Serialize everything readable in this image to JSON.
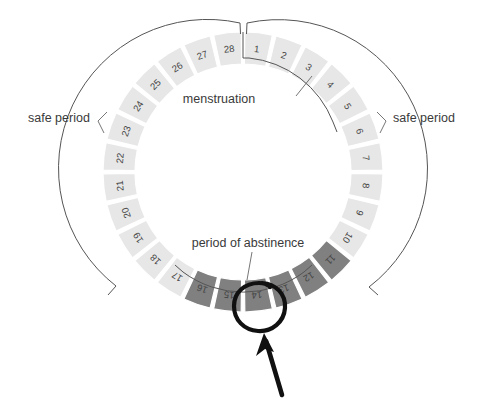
{
  "diagram": {
    "title_semantic": "menstrual-cycle-calendar-wheel",
    "cycle_length": 28,
    "center": {
      "x": 243,
      "y": 172
    },
    "ring": {
      "inner_radius": 108,
      "outer_radius": 140
    },
    "day_numbers": [
      1,
      2,
      3,
      4,
      5,
      6,
      7,
      8,
      9,
      10,
      11,
      12,
      13,
      14,
      15,
      16,
      17,
      18,
      19,
      20,
      21,
      22,
      23,
      24,
      25,
      26,
      27,
      28
    ],
    "segment_phase": [
      "safe",
      "safe",
      "safe",
      "safe",
      "safe",
      "safe",
      "safe",
      "safe",
      "safe",
      "safe",
      "abstinence",
      "abstinence",
      "abstinence",
      "abstinence",
      "abstinence",
      "abstinence",
      "safe",
      "safe",
      "safe",
      "safe",
      "safe",
      "safe",
      "safe",
      "safe",
      "safe",
      "safe",
      "safe",
      "safe"
    ],
    "abstinence_days": [
      11,
      12,
      13,
      14,
      15,
      16
    ],
    "menstruation_days": [
      1,
      2,
      3,
      4,
      5
    ],
    "highlighted_day": 14
  },
  "labels": {
    "menstruation": "menstruation",
    "period_of_abstinence": "period of abstinence",
    "safe_period_left": "safe period",
    "safe_period_right": "safe period"
  },
  "colors": {
    "segment_light": "#e7e7e7",
    "segment_dark": "#808080",
    "segment_gap": "#ffffff",
    "number_text": "#444444",
    "label_text": "#3a3a3a",
    "outline": "#555555",
    "annotation_mark": "#111111",
    "background": "#ffffff"
  }
}
